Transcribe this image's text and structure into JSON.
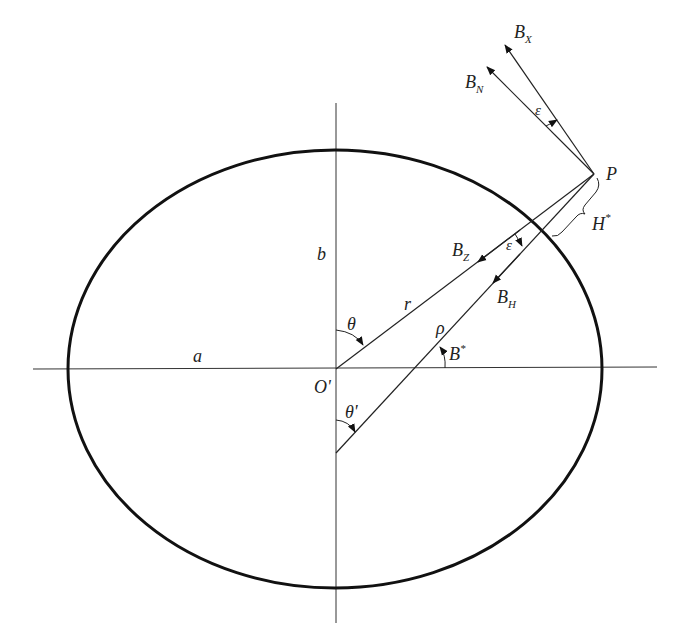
{
  "diagram": {
    "type": "ellipsoid-geometry",
    "colors": {
      "stroke": "#222222",
      "ellipse": "#111111",
      "background": "#ffffff"
    },
    "labels": {
      "a": "a",
      "b": "b",
      "origin": "O'",
      "r": "r",
      "rho": "ρ",
      "theta": "θ",
      "theta_prime": "θ'",
      "B_star_base": "B",
      "B_star_sup": "*",
      "epsilon_top": "ε",
      "epsilon_mid": "ε",
      "P": "P",
      "H_star_base": "H",
      "H_star_sup": "*",
      "BX_base": "B",
      "BX_sub": "X",
      "BN_base": "B",
      "BN_sub": "N",
      "BZ_base": "B",
      "BZ_sub": "Z",
      "BH_base": "B",
      "BH_sub": "H"
    },
    "geometry": {
      "ellipse": {
        "cx": 335,
        "cy": 369,
        "rx": 267,
        "ry": 219
      },
      "x_axis": {
        "x1": 33,
        "y1": 369,
        "x2": 657,
        "y2": 367
      },
      "y_axis": {
        "x1": 336,
        "y1": 103,
        "x2": 336,
        "y2": 623
      },
      "point_P": {
        "x": 594,
        "y": 174
      },
      "geocentric_line": {
        "from": "O'",
        "to": "P"
      },
      "geodetic_normal": {
        "from": [
          336,
          453
        ],
        "to": "P"
      },
      "vectors": [
        "B_X",
        "B_N",
        "B_Z",
        "B_H"
      ]
    }
  }
}
